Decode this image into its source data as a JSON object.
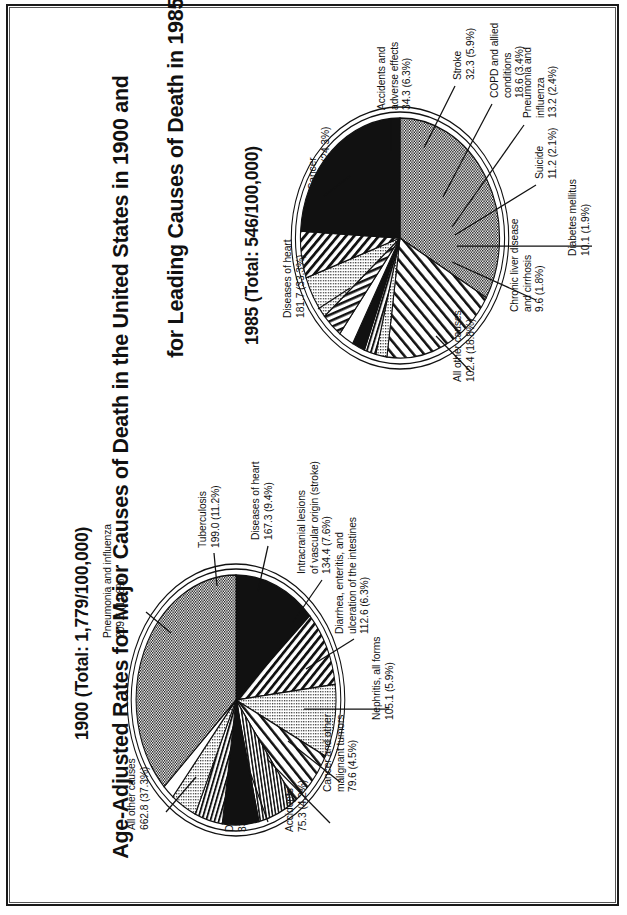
{
  "figure": {
    "title_line1": "Age-Adjusted Rates for Major Causes of Death in the United States in 1900 and",
    "title_line2": "for Leading Causes of Death in 1985"
  },
  "charts": [
    {
      "id": "chart-1985",
      "heading": "1985 (Total: 546/100,000)",
      "year": "1985",
      "total": "546/100,000"
    },
    {
      "id": "chart-1900",
      "heading": "1900 (Total: 1,779/100,000)",
      "year": "1900",
      "total": "1,779/100,000"
    }
  ],
  "chart_data": [
    {
      "type": "pie",
      "title": "1985 (Total: 546/100,000)",
      "total_rate": 546,
      "unit": "deaths per 100,000",
      "categories": [
        "Diseases of heart",
        "Cancer",
        "Accidents and adverse effects",
        "Stroke",
        "COPD and allied conditions",
        "Pneumonia and influenza",
        "Suicide",
        "Diabetes mellitus",
        "Chronic liver disease and cirrhosis",
        "All other causes"
      ],
      "values": [
        181.7,
        132.5,
        34.3,
        32.3,
        18.6,
        13.2,
        11.2,
        10.1,
        9.6,
        102.4
      ],
      "percents": [
        33.3,
        24.3,
        6.3,
        5.9,
        3.4,
        2.4,
        2.1,
        1.9,
        1.8,
        18.8
      ],
      "labels": [
        "Diseases of heart\n181.7 (33.3%)",
        "Cancer\n132.5 (24.3%)",
        "Accidents and\nadverse effects\n34.3 (6.3%)",
        "Stroke\n32.3 (5.9%)",
        "COPD and allied\nconditions\n18.6 (3.4%)",
        "Pneumonia and\ninfluenza\n13.2 (2.4%)",
        "Suicide\n11.2 (2.1%)",
        "Diabetes mellitus\n10.1 (1.9%)",
        "Chronic liver disease\nand cirrhosis\n9.6 (1.8%)",
        "All other causes\n102.4 (18.8%)"
      ],
      "legend": "none",
      "grid": false
    },
    {
      "type": "pie",
      "title": "1900 (Total: 1,779/100,000)",
      "total_rate": 1779,
      "unit": "deaths per 100,000",
      "categories": [
        "Pneumonia and influenza",
        "Tuberculosis",
        "Diseases of heart",
        "Intracranial lesions of vascular origin (stroke)",
        "Diarrhea, enteritis, and ulceration of the intestines",
        "Nephritis, all forms",
        "Cancer and other malignant tumors",
        "Accidents",
        "Diphtheria",
        "All other causes"
      ],
      "values": [
        209.5,
        199.0,
        167.3,
        134.4,
        112.6,
        105.1,
        79.6,
        75.3,
        33.4,
        662.8
      ],
      "percents": [
        11.8,
        11.2,
        9.4,
        7.6,
        6.3,
        5.9,
        4.5,
        4.2,
        1.9,
        37.3
      ],
      "labels": [
        "Pneumonia and influenza\n209.5 (11.8%)",
        "Tuberculosis\n199.0 (11.2%)",
        "Diseases of heart\n167.3 (9.4%)",
        "Intracranial lesions\nof vascular origin (stroke)\n134.4 (7.6%)",
        "Diarrhea, enteritis, and\nulceration of the intestines\n112.6 (6.3%)",
        "Nephritis, all forms\n105.1 (5.9%)",
        "Cancer and other\nmalignant tumors\n79.6 (4.5%)",
        "Accidents\n75.3 (4.2%)",
        "Diphtheria\n33.4 (1.9%)",
        "All other causes\n662.8 (37.3%)"
      ],
      "legend": "none",
      "grid": false
    }
  ]
}
